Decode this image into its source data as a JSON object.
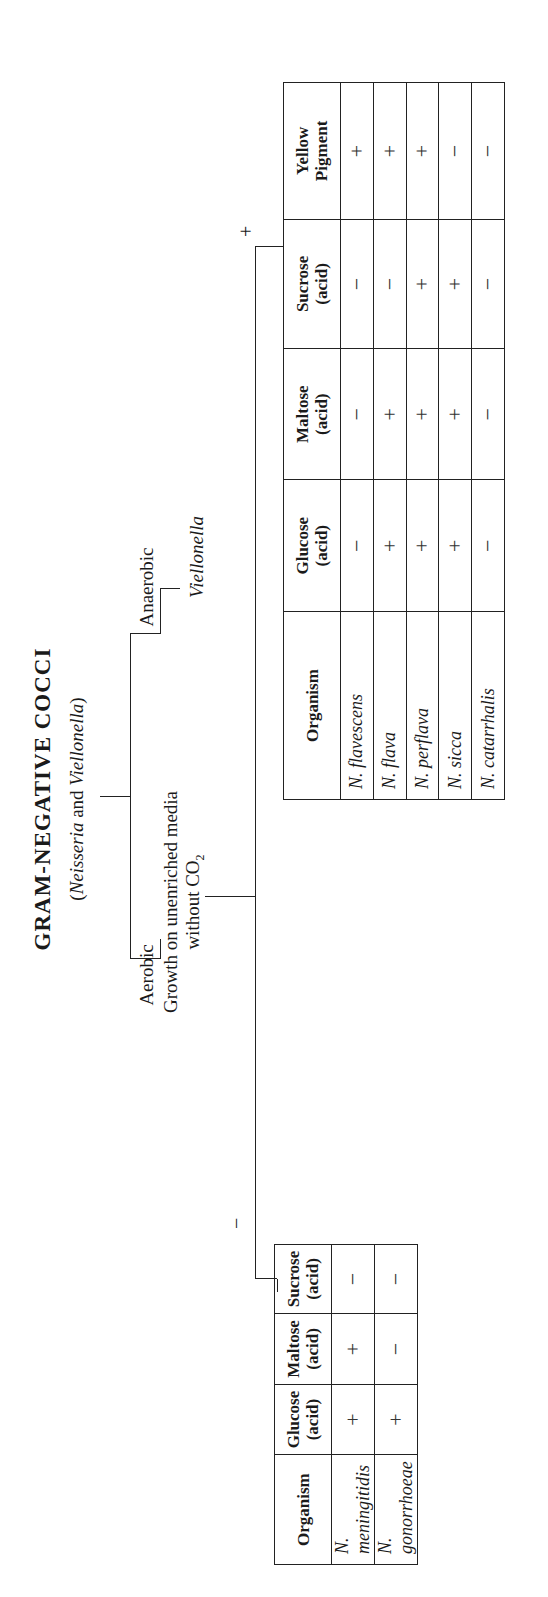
{
  "title": "GRAM-NEGATIVE COCCI",
  "subtitle": {
    "open": "(",
    "genus1": "Neisseria",
    "and": " and ",
    "genus2": "Viellonella",
    "close": ")"
  },
  "branches": {
    "aerobic": "Aerobic",
    "anaerobic": "Anaerobic",
    "anaerobic_result": "Viellonella",
    "growth_test_line1": "Growth on unenriched media",
    "growth_test_line2_prefix": "without CO",
    "growth_test_line2_sub": "2",
    "negative_sign": "−",
    "positive_sign": "+"
  },
  "table_negative": {
    "headers": [
      {
        "line1": "Organism",
        "line2": ""
      },
      {
        "line1": "Glucose",
        "line2": "(acid)"
      },
      {
        "line1": "Maltose",
        "line2": "(acid)"
      },
      {
        "line1": "Sucrose",
        "line2": "(acid)"
      }
    ],
    "rows": [
      {
        "organism": "N. meningitidis",
        "glucose": "+",
        "maltose": "+",
        "sucrose": "−"
      },
      {
        "organism": "N. gonorrhoeae",
        "glucose": "+",
        "maltose": "−",
        "sucrose": "−"
      }
    ]
  },
  "table_positive": {
    "headers": [
      {
        "line1": "Organism",
        "line2": ""
      },
      {
        "line1": "Glucose",
        "line2": "(acid)"
      },
      {
        "line1": "Maltose",
        "line2": "(acid)"
      },
      {
        "line1": "Sucrose",
        "line2": "(acid)"
      },
      {
        "line1": "Yellow",
        "line2": "Pigment"
      }
    ],
    "rows": [
      {
        "organism": "N. flavescens",
        "glucose": "−",
        "maltose": "−",
        "sucrose": "−",
        "pigment": "+"
      },
      {
        "organism": "N. flava",
        "glucose": "+",
        "maltose": "+",
        "sucrose": "−",
        "pigment": "+"
      },
      {
        "organism": "N. perflava",
        "glucose": "+",
        "maltose": "+",
        "sucrose": "+",
        "pigment": "+"
      },
      {
        "organism": "N. sicca",
        "glucose": "+",
        "maltose": "+",
        "sucrose": "+",
        "pigment": "−"
      },
      {
        "organism": "N. catarrhalis",
        "glucose": "−",
        "maltose": "−",
        "sucrose": "−",
        "pigment": "−"
      }
    ]
  }
}
